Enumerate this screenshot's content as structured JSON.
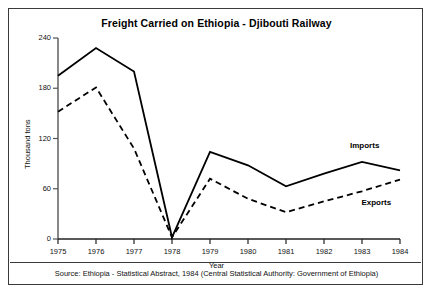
{
  "chart_data": {
    "type": "line",
    "title": "Freight Carried on Ethiopia - Djibouti Railway",
    "xlabel": "Year",
    "ylabel": "Thousand tons",
    "x": [
      1975,
      1976,
      1977,
      1978,
      1979,
      1980,
      1981,
      1982,
      1983,
      1984
    ],
    "xtick_labels": [
      "1975",
      "1976",
      "1977",
      "1978",
      "1979",
      "1980",
      "1981",
      "1982",
      "1983",
      "1984"
    ],
    "ytick_labels": [
      "0",
      "60",
      "120",
      "180",
      "240"
    ],
    "yticks": [
      0,
      60,
      120,
      180,
      240
    ],
    "ylim": [
      0,
      240
    ],
    "xlim": [
      1975,
      1984
    ],
    "grid": false,
    "legend_position": "inline-right",
    "series": [
      {
        "name": "Imports",
        "style": "solid",
        "color": "#000000",
        "values": [
          195,
          228,
          200,
          2,
          104,
          88,
          63,
          78,
          92,
          82
        ]
      },
      {
        "name": "Exports",
        "style": "dashed",
        "color": "#000000",
        "values": [
          152,
          181,
          108,
          2,
          72,
          48,
          32,
          45,
          57,
          71
        ]
      }
    ],
    "annotations": [
      {
        "text": "Imports",
        "x": 1983,
        "y": 110
      },
      {
        "text": "Exports",
        "x": 1983.3,
        "y": 42
      }
    ],
    "source": "Source: Ethiopia - Statistical Abstract, 1984 (Central Statistical Authority: Government of Ethiopia)"
  }
}
